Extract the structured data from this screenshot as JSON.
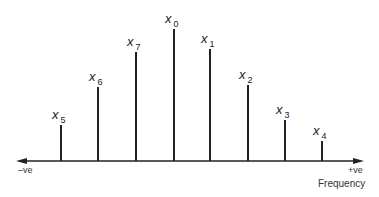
{
  "diagram": {
    "axis": {
      "neg_label": "–ve",
      "pos_label": "+ve",
      "title": "Frequency"
    },
    "stems": [
      {
        "name": "x5",
        "base": "x",
        "sub": "5",
        "x": 61,
        "top": 125
      },
      {
        "name": "x6",
        "base": "x",
        "sub": "6",
        "x": 98,
        "top": 87
      },
      {
        "name": "x7",
        "base": "x",
        "sub": "7",
        "x": 136,
        "top": 52
      },
      {
        "name": "x0",
        "base": "x",
        "sub": "0",
        "x": 174,
        "top": 29
      },
      {
        "name": "x1",
        "base": "x",
        "sub": "1",
        "x": 210,
        "top": 49
      },
      {
        "name": "x2",
        "base": "x",
        "sub": "2",
        "x": 248,
        "top": 85
      },
      {
        "name": "x3",
        "base": "x",
        "sub": "3",
        "x": 285,
        "top": 120
      },
      {
        "name": "x4",
        "base": "x",
        "sub": "4",
        "x": 322,
        "top": 141
      }
    ],
    "colors": {
      "ink": "#222222"
    }
  }
}
